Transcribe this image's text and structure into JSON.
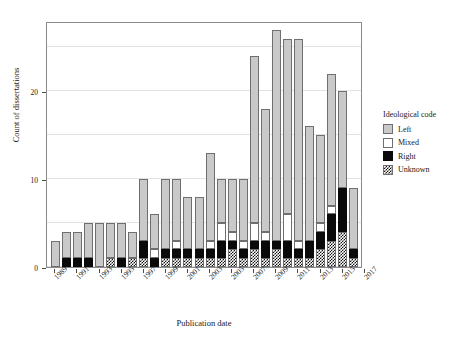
{
  "chart_data": {
    "type": "bar",
    "subtype": "stacked-bar",
    "title": "",
    "xlabel": "Publication date",
    "ylabel": "Count of dissertations",
    "ylim": [
      0,
      28
    ],
    "yticks": [
      0,
      10,
      20
    ],
    "gridlines": [
      0,
      5,
      10,
      15,
      20,
      25
    ],
    "grid": true,
    "legend_title": "Ideological code",
    "legend_position": "right",
    "legend": [
      "Left",
      "Mixed",
      "Right",
      "Unknown"
    ],
    "colors": {
      "Left": "#c9c9c9",
      "Mixed": "#ffffff",
      "Right": "#0a0a0a",
      "Unknown": "#checkered",
      "panel_border": "#8a8a8a",
      "gridline": "#e2e2e2"
    },
    "stack_order_bottom_to_top": [
      "Unknown",
      "Right",
      "Mixed",
      "Left"
    ],
    "xticks": [
      "1989",
      "1991",
      "1993",
      "1995",
      "1997",
      "1999",
      "2001",
      "2003",
      "2005",
      "2007",
      "2009",
      "2011",
      "2013",
      "2015",
      "2017"
    ],
    "categories": [
      "1989",
      "1990",
      "1991",
      "1992",
      "1993",
      "1994",
      "1995",
      "1996",
      "1997",
      "1998",
      "1999",
      "2000",
      "2001",
      "2002",
      "2003",
      "2004",
      "2005",
      "2006",
      "2007",
      "2008",
      "2009",
      "2010",
      "2011",
      "2012",
      "2013",
      "2014",
      "2015",
      "2016"
    ],
    "series": [
      {
        "name": "Unknown",
        "values": [
          0,
          0,
          0,
          0,
          0,
          1,
          0,
          1,
          1,
          0,
          1,
          1,
          1,
          1,
          1,
          1,
          2,
          1,
          2,
          1,
          2,
          1,
          1,
          1,
          2,
          3,
          4,
          1
        ]
      },
      {
        "name": "Right",
        "values": [
          0,
          1,
          1,
          1,
          0,
          0,
          1,
          0,
          2,
          1,
          1,
          1,
          1,
          1,
          1,
          2,
          1,
          1,
          1,
          2,
          1,
          2,
          1,
          2,
          2,
          3,
          5,
          1
        ]
      },
      {
        "name": "Mixed",
        "values": [
          0,
          0,
          0,
          0,
          0,
          0,
          0,
          0,
          0,
          1,
          0,
          1,
          0,
          0,
          1,
          2,
          1,
          1,
          2,
          1,
          0,
          3,
          1,
          0,
          1,
          1,
          0,
          0
        ]
      },
      {
        "name": "Left",
        "values": [
          3,
          3,
          3,
          4,
          5,
          4,
          4,
          3,
          7,
          4,
          8,
          7,
          6,
          6,
          10,
          5,
          6,
          7,
          19,
          14,
          24,
          20,
          23,
          13,
          10,
          15,
          11,
          7
        ]
      }
    ],
    "totals": [
      3,
      4,
      4,
      5,
      5,
      5,
      5,
      4,
      10,
      6,
      10,
      10,
      8,
      8,
      13,
      10,
      10,
      10,
      24,
      18,
      27,
      26,
      26,
      16,
      15,
      22,
      20,
      9
    ]
  }
}
